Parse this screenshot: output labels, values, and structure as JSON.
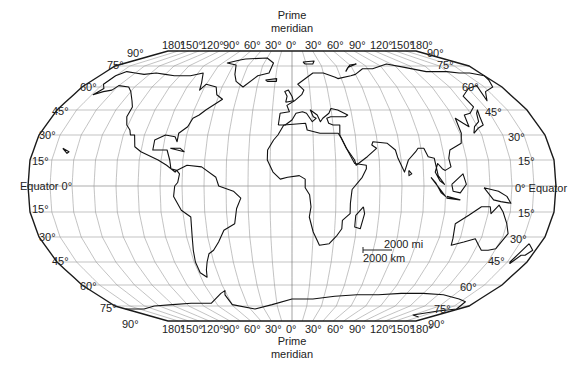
{
  "map": {
    "projection": "Robinson",
    "prime_meridian_label_top": [
      "Prime",
      "meridian"
    ],
    "prime_meridian_label_bottom": [
      "Prime",
      "meridian"
    ],
    "equator_label_left": "Equator 0°",
    "equator_label_right": "0° Equator",
    "longitude_labels_top": [
      "180°",
      "150°",
      "120°",
      "90°",
      "60°",
      "30°",
      "0°",
      "30°",
      "60°",
      "90°",
      "120°",
      "150°",
      "180°"
    ],
    "longitude_labels_bottom": [
      "180°",
      "150°",
      "120°",
      "90°",
      "60°",
      "30°",
      "0°",
      "30°",
      "60°",
      "90°",
      "120°",
      "150°",
      "180°"
    ],
    "latitude_labels_left": [
      "90°",
      "75°",
      "60°",
      "45°",
      "30°",
      "15°",
      "15°",
      "30°",
      "45°",
      "60°",
      "75°",
      "90°"
    ],
    "latitude_labels_right": [
      "90°",
      "75°",
      "60°",
      "45°",
      "30°",
      "15°",
      "15°",
      "30°",
      "45°",
      "60°",
      "75°",
      "90°"
    ],
    "scale_bar": {
      "miles_label": "2000 mi",
      "km_label": "2000 km"
    },
    "colors": {
      "outline": "#1a1a1a",
      "graticule": "#9a9a9a",
      "coastline": "#111111",
      "background": "#ffffff"
    }
  }
}
